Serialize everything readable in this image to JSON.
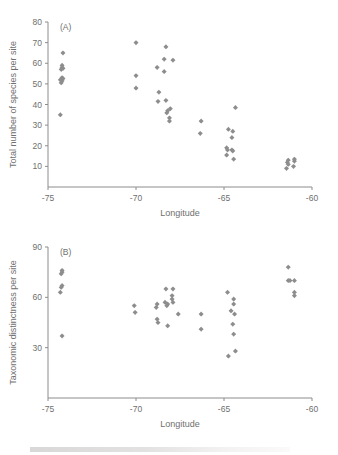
{
  "figure": {
    "background": "#ffffff",
    "marker_color": "#8d8d8d",
    "axis_color": "#8c8c8c",
    "text_color": "#6f6f6f"
  },
  "panels": {
    "a": {
      "label": "(A)",
      "name": "panel-a"
    },
    "b": {
      "label": "(B)",
      "name": "panel-b"
    }
  },
  "chart_data": [
    {
      "type": "scatter",
      "panel": "(A)",
      "title": "",
      "xlabel": "Longitude",
      "ylabel": "Total number of species per site",
      "xlim": [
        -75,
        -60
      ],
      "ylim": [
        0,
        80
      ],
      "xticks": [
        -75,
        -70,
        -65,
        -60
      ],
      "xtick_labels": [
        "-75",
        "-70",
        "-65",
        "-60"
      ],
      "yticks": [
        10,
        20,
        30,
        40,
        50,
        60,
        70,
        80
      ],
      "ytick_labels": [
        "10",
        "20",
        "30",
        "40",
        "50",
        "60",
        "70",
        "80"
      ],
      "grid": false,
      "legend": "none",
      "marker": "diamond",
      "points": [
        {
          "x": -74.15,
          "y": 65
        },
        {
          "x": -74.2,
          "y": 59
        },
        {
          "x": -74.2,
          "y": 58
        },
        {
          "x": -74.15,
          "y": 57.5
        },
        {
          "x": -74.25,
          "y": 57
        },
        {
          "x": -74.2,
          "y": 53
        },
        {
          "x": -74.15,
          "y": 52.5
        },
        {
          "x": -74.3,
          "y": 52
        },
        {
          "x": -74.2,
          "y": 51.5
        },
        {
          "x": -74.25,
          "y": 50.5
        },
        {
          "x": -74.3,
          "y": 35
        },
        {
          "x": -70.0,
          "y": 70
        },
        {
          "x": -70.0,
          "y": 54
        },
        {
          "x": -70.0,
          "y": 48
        },
        {
          "x": -68.3,
          "y": 68
        },
        {
          "x": -68.4,
          "y": 62
        },
        {
          "x": -68.4,
          "y": 56
        },
        {
          "x": -68.8,
          "y": 58
        },
        {
          "x": -67.9,
          "y": 61.5
        },
        {
          "x": -68.7,
          "y": 46
        },
        {
          "x": -68.75,
          "y": 41.5
        },
        {
          "x": -68.3,
          "y": 42
        },
        {
          "x": -68.2,
          "y": 37
        },
        {
          "x": -68.25,
          "y": 36
        },
        {
          "x": -68.05,
          "y": 38
        },
        {
          "x": -68.1,
          "y": 33.5
        },
        {
          "x": -68.1,
          "y": 32
        },
        {
          "x": -66.3,
          "y": 32
        },
        {
          "x": -66.35,
          "y": 26
        },
        {
          "x": -64.35,
          "y": 38.5
        },
        {
          "x": -64.75,
          "y": 28
        },
        {
          "x": -64.5,
          "y": 27
        },
        {
          "x": -64.55,
          "y": 24
        },
        {
          "x": -64.85,
          "y": 19
        },
        {
          "x": -64.8,
          "y": 18
        },
        {
          "x": -64.55,
          "y": 18
        },
        {
          "x": -64.5,
          "y": 17.5
        },
        {
          "x": -64.85,
          "y": 15.5
        },
        {
          "x": -64.45,
          "y": 13.5
        },
        {
          "x": -61.35,
          "y": 13
        },
        {
          "x": -61.4,
          "y": 12
        },
        {
          "x": -61.35,
          "y": 11
        },
        {
          "x": -61.45,
          "y": 9
        },
        {
          "x": -61.0,
          "y": 13.5
        },
        {
          "x": -61.0,
          "y": 12.5
        },
        {
          "x": -61.05,
          "y": 10
        }
      ]
    },
    {
      "type": "scatter",
      "panel": "(B)",
      "title": "",
      "xlabel": "Longitude",
      "ylabel": "Taxonomic distinctness per site",
      "xlim": [
        -75,
        -60
      ],
      "ylim": [
        0,
        90
      ],
      "xticks": [
        -75,
        -70,
        -65,
        -60
      ],
      "xtick_labels": [
        "-75",
        "-70",
        "-65",
        "-60"
      ],
      "yticks": [
        30,
        60,
        90
      ],
      "ytick_labels": [
        "30",
        "60",
        "90"
      ],
      "grid": false,
      "legend": "none",
      "marker": "diamond",
      "points": [
        {
          "x": -74.2,
          "y": 76
        },
        {
          "x": -74.2,
          "y": 75
        },
        {
          "x": -74.25,
          "y": 74
        },
        {
          "x": -74.2,
          "y": 67
        },
        {
          "x": -74.25,
          "y": 66
        },
        {
          "x": -74.3,
          "y": 63
        },
        {
          "x": -74.2,
          "y": 37
        },
        {
          "x": -70.1,
          "y": 55
        },
        {
          "x": -70.05,
          "y": 51
        },
        {
          "x": -68.8,
          "y": 56
        },
        {
          "x": -68.85,
          "y": 54
        },
        {
          "x": -68.8,
          "y": 47
        },
        {
          "x": -68.75,
          "y": 45
        },
        {
          "x": -68.3,
          "y": 65
        },
        {
          "x": -68.35,
          "y": 57
        },
        {
          "x": -68.2,
          "y": 56
        },
        {
          "x": -68.25,
          "y": 55
        },
        {
          "x": -68.2,
          "y": 43
        },
        {
          "x": -67.9,
          "y": 65
        },
        {
          "x": -67.95,
          "y": 61
        },
        {
          "x": -67.95,
          "y": 59
        },
        {
          "x": -67.9,
          "y": 57
        },
        {
          "x": -67.6,
          "y": 50
        },
        {
          "x": -66.3,
          "y": 50
        },
        {
          "x": -66.3,
          "y": 41
        },
        {
          "x": -64.8,
          "y": 63
        },
        {
          "x": -64.45,
          "y": 59
        },
        {
          "x": -64.45,
          "y": 56
        },
        {
          "x": -64.6,
          "y": 52
        },
        {
          "x": -64.4,
          "y": 50
        },
        {
          "x": -64.5,
          "y": 44
        },
        {
          "x": -64.45,
          "y": 38
        },
        {
          "x": -64.35,
          "y": 28
        },
        {
          "x": -64.75,
          "y": 25
        },
        {
          "x": -61.35,
          "y": 78
        },
        {
          "x": -61.35,
          "y": 70
        },
        {
          "x": -61.25,
          "y": 70
        },
        {
          "x": -61.0,
          "y": 70
        },
        {
          "x": -61.0,
          "y": 63
        },
        {
          "x": -61.0,
          "y": 61
        }
      ]
    }
  ]
}
